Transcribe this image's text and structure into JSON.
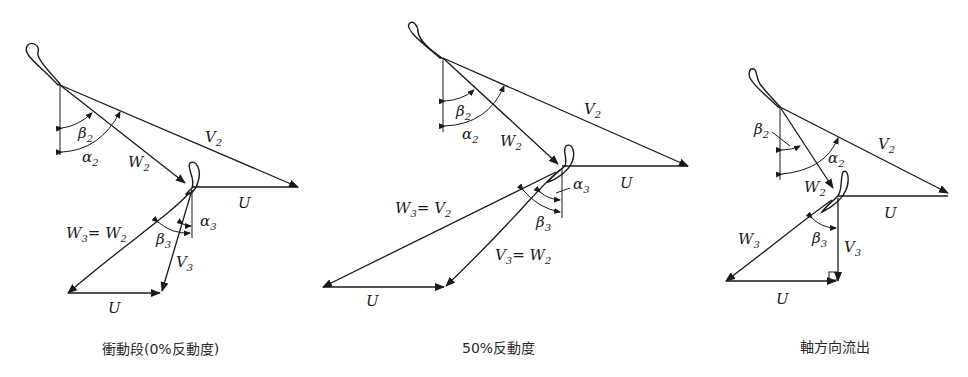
{
  "figure": {
    "panels": [
      {
        "id": "impulse",
        "caption": "衝動段(0%反動度)",
        "labels": {
          "v2": "V",
          "v2_sub": "2",
          "w2": "W",
          "w2_sub": "2",
          "beta2": "β",
          "beta2_sub": "2",
          "alpha2": "α",
          "alpha2_sub": "2",
          "u_top": "U",
          "w3": "W",
          "w3_sub": "3",
          "w3_eq": "= W",
          "w3_eq_sub": "2",
          "beta3": "β",
          "beta3_sub": "3",
          "alpha3": "α",
          "alpha3_sub": "3",
          "v3": "V",
          "v3_sub": "3",
          "u_bottom": "U"
        }
      },
      {
        "id": "reaction50",
        "caption": "50%反動度",
        "labels": {
          "v2": "V",
          "v2_sub": "2",
          "w2": "W",
          "w2_sub": "2",
          "beta2": "β",
          "beta2_sub": "2",
          "alpha2": "α",
          "alpha2_sub": "2",
          "u_top": "U",
          "w3": "W",
          "w3_sub": "3",
          "w3_eq": "= V",
          "w3_eq_sub": "2",
          "beta3": "β",
          "beta3_sub": "3",
          "alpha3": "α",
          "alpha3_sub": "3",
          "v3": "V",
          "v3_sub": "3",
          "v3_eq": "= W",
          "v3_eq_sub": "2",
          "u_bottom": "U"
        }
      },
      {
        "id": "axial-exit",
        "caption": "軸方向流出",
        "labels": {
          "v2": "V",
          "v2_sub": "2",
          "w2": "W",
          "w2_sub": "2",
          "beta2": "β",
          "beta2_sub": "2",
          "alpha2": "α",
          "alpha2_sub": "2",
          "u_top": "U",
          "w3": "W",
          "w3_sub": "3",
          "beta3": "β",
          "beta3_sub": "3",
          "v3": "V",
          "v3_sub": "3",
          "u_bottom": "U"
        }
      }
    ]
  }
}
